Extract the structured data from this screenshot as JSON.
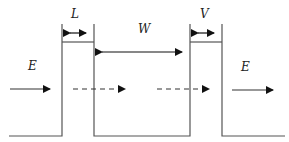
{
  "diagram": {
    "labels": {
      "barrier_left_width": "L",
      "well_width": "W",
      "barrier_right_width": "V",
      "incident_energy": "E",
      "transmitted_energy": "E"
    },
    "colors": {
      "line": "#555555",
      "text": "#222222",
      "background": "#ffffff"
    }
  }
}
